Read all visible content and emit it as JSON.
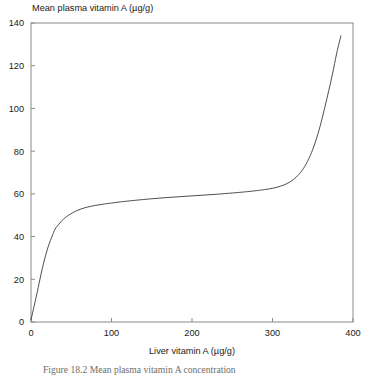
{
  "figure": {
    "caption_label": "Figure 18.2",
    "caption_text": "Mean plasma vitamin A concentration"
  },
  "chart_data": {
    "type": "line",
    "title": "",
    "xlabel": "Liver vitamin A (µg/g)",
    "ylabel": "Mean plasma vitamin A (µg/g)",
    "xlim": [
      0,
      400
    ],
    "ylim": [
      0,
      140
    ],
    "xticks": [
      0,
      100,
      200,
      300,
      400
    ],
    "yticks": [
      0,
      20,
      40,
      60,
      80,
      100,
      120,
      140
    ],
    "xtick_labels": [
      "0",
      "100",
      "200",
      "300",
      "400"
    ],
    "ytick_labels": [
      "0",
      "20",
      "40",
      "60",
      "80",
      "100",
      "120",
      "140"
    ],
    "grid": false,
    "legend": false,
    "legend_position": "none",
    "line_color": "#3a3a3a",
    "line_width": 0.9,
    "frame": true,
    "tick_direction": "in",
    "series": [
      {
        "name": "Mean plasma vitamin A",
        "x": [
          0,
          3,
          6,
          10,
          14,
          18,
          22,
          26,
          30,
          34,
          38,
          43,
          48,
          55,
          62,
          70,
          80,
          90,
          100,
          115,
          130,
          150,
          170,
          190,
          210,
          230,
          250,
          265,
          280,
          290,
          300,
          310,
          318,
          326,
          333,
          340,
          347,
          353,
          359,
          365,
          370,
          375,
          379,
          382,
          385
        ],
        "y": [
          1,
          6,
          11,
          18,
          25,
          31,
          36,
          40,
          43.5,
          45.5,
          47.3,
          49,
          50.3,
          51.8,
          52.9,
          53.8,
          54.6,
          55.2,
          55.7,
          56.4,
          57,
          57.7,
          58.3,
          58.8,
          59.3,
          59.8,
          60.4,
          60.9,
          61.5,
          62,
          62.6,
          63.6,
          64.8,
          66.7,
          69.2,
          72.8,
          78,
          84,
          91.5,
          100.5,
          108.5,
          117,
          124.5,
          129.5,
          134
        ]
      }
    ]
  }
}
